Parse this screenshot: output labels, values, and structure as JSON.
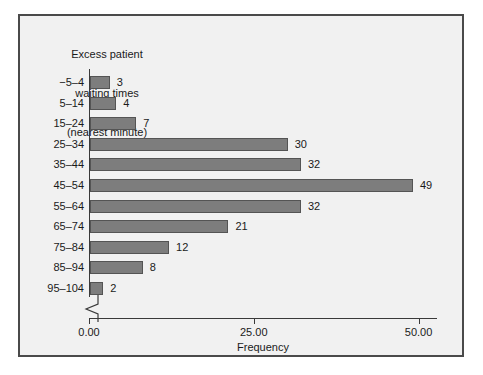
{
  "chart_data": {
    "type": "bar",
    "orientation": "horizontal",
    "title": "Excess patient\nwaiting times\n(nearest minute)",
    "title_lines": [
      "Excess patient",
      "waiting times",
      "(nearest minute)"
    ],
    "xlabel": "Frequency",
    "ylabel": "Excess patient waiting times (nearest minute)",
    "categories": [
      "−5–4",
      "5–14",
      "15–24",
      "25–34",
      "35–44",
      "45–54",
      "55–64",
      "65–74",
      "75–84",
      "85–94",
      "95–104"
    ],
    "values": [
      3,
      4,
      7,
      30,
      32,
      49,
      32,
      21,
      12,
      8,
      2
    ],
    "data_labels": [
      "3",
      "4",
      "7",
      "30",
      "32",
      "49",
      "32",
      "21",
      "12",
      "8",
      "2"
    ],
    "xlim": [
      0,
      52.8
    ],
    "xticks": [
      0,
      25,
      50
    ],
    "xtick_labels": [
      "0.00",
      "25.00",
      "50.00"
    ],
    "grid": false,
    "legend": false,
    "axis_break": true,
    "bar_color": "#7d7d7d",
    "bar_border_color": "#545454",
    "background_color": "#f1f1f1",
    "frame_color": "#4a4a4a",
    "text_color": "#1a1a1a"
  }
}
